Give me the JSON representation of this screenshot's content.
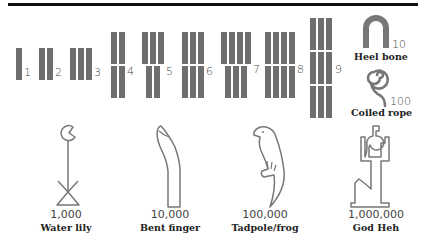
{
  "strokes": [
    {
      "value": "1",
      "top": 1,
      "bottom": 0,
      "middle": 0
    },
    {
      "value": "2",
      "top": 2,
      "bottom": 0,
      "middle": 0
    },
    {
      "value": "3",
      "top": 3,
      "bottom": 0,
      "middle": 0
    },
    {
      "value": "4",
      "top": 2,
      "bottom": 2,
      "middle": 0
    },
    {
      "value": "5",
      "top": 3,
      "bottom": 2,
      "middle": 0
    },
    {
      "value": "6",
      "top": 3,
      "bottom": 3,
      "middle": 0
    },
    {
      "value": "7",
      "top": 4,
      "bottom": 3,
      "middle": 0
    },
    {
      "value": "8",
      "top": 4,
      "bottom": 4,
      "middle": 0
    },
    {
      "value": "9",
      "top": 3,
      "middle": 3,
      "bottom": 3
    }
  ],
  "symbols": [
    {
      "icon": "heel-bone-icon",
      "value": "10",
      "name": "Heel bone"
    },
    {
      "icon": "coiled-rope-icon",
      "value": "100",
      "name": "Coiled rope"
    },
    {
      "icon": "water-lily-icon",
      "value": "1,000",
      "name": "Water lily"
    },
    {
      "icon": "bent-finger-icon",
      "value": "10,000",
      "name": "Bent finger"
    },
    {
      "icon": "tadpole-frog-icon",
      "value": "100,000",
      "name": "Tadpole/frog"
    },
    {
      "icon": "god-heh-icon",
      "value": "1,000,000",
      "name": "God Heh"
    }
  ],
  "colors": {
    "stroke_bar": "#6e6e6e",
    "outline": "#777777",
    "rule": "#111111"
  }
}
